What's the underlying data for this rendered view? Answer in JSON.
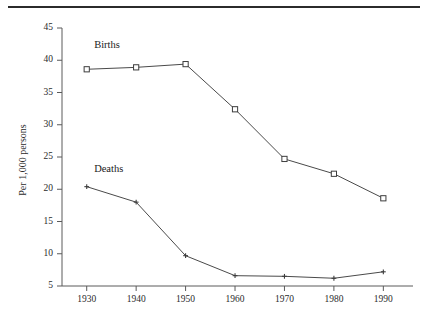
{
  "figure": {
    "background_color": "#ffffff",
    "rule_color": "#2b2b2b",
    "line_color": "#4a4a4a",
    "axis_color": "#5a5a5a",
    "text_color": "#1a1a1a"
  },
  "labels": {
    "births": "Births",
    "deaths": "Deaths",
    "ylabel": "Per 1,000 persons"
  },
  "chart_data": {
    "type": "line",
    "title": "",
    "xlabel": "",
    "ylabel": "Per 1,000 persons",
    "x": [
      1930,
      1940,
      1950,
      1960,
      1970,
      1980,
      1990
    ],
    "xtick_labels": [
      "1930",
      "1940",
      "1950",
      "1960",
      "1970",
      "1980",
      "1990"
    ],
    "ytick_labels": [
      "5",
      "10",
      "15",
      "20",
      "25",
      "30",
      "35",
      "40",
      "45"
    ],
    "yticks": [
      5,
      10,
      15,
      20,
      25,
      30,
      35,
      40,
      45
    ],
    "xlim": [
      1925,
      1996
    ],
    "ylim": [
      5,
      45
    ],
    "grid": false,
    "legend": "inline-labels",
    "series": [
      {
        "name": "Births",
        "marker": "open-square",
        "values": [
          38.6,
          38.9,
          39.4,
          32.4,
          24.7,
          22.4,
          18.6
        ],
        "label_text": "Births"
      },
      {
        "name": "Deaths",
        "marker": "cross",
        "values": [
          20.4,
          18.0,
          9.7,
          6.6,
          6.5,
          6.2,
          7.2
        ],
        "label_text": "Deaths"
      }
    ]
  }
}
